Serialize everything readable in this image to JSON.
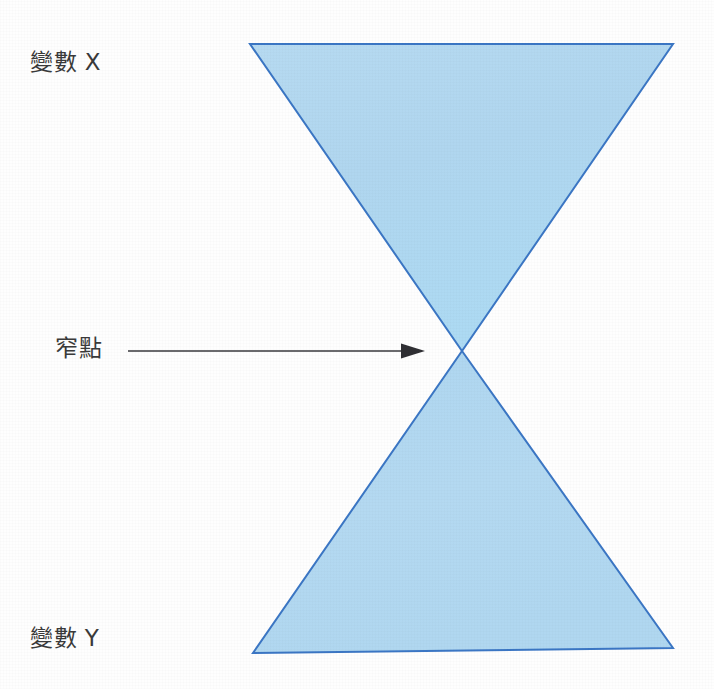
{
  "diagram": {
    "title": "",
    "type": "hourglass-bowtie",
    "background_color": "#fefefe",
    "labels": {
      "top": "變數 X",
      "middle": "窄點",
      "bottom": "變數 Y"
    },
    "shape_style": {
      "fill_color": "#b3d8f0",
      "stroke_color": "#3b76c4",
      "stroke_width": "2"
    },
    "annotation_arrow": {
      "name": "bottleneck-arrow",
      "color": "#39393c",
      "line_start_x": 128,
      "line_end_x": 425,
      "line_y": 351,
      "head_width": 24,
      "head_height": 15
    },
    "shapes": [
      {
        "name": "upper-triangle",
        "label_ref": "變數 X",
        "points": "250,44 673,44 462,351"
      },
      {
        "name": "lower-triangle",
        "label_ref": "變數 Y",
        "points": "462,351 673,648 253,653"
      }
    ],
    "apex": {
      "name": "narrow-point",
      "x": 462,
      "y": 351
    }
  }
}
